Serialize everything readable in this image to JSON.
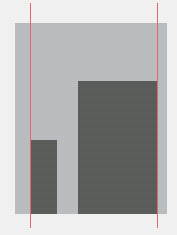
{
  "figure": {
    "title": "",
    "canvas_width": 177,
    "canvas_height": 235,
    "background_color": "#f2f2f2",
    "panel_color": "#b9bdc0",
    "bar_color": "#595b59",
    "guide_color": "#e8646a",
    "caption": ""
  },
  "chart_data": {
    "type": "bar",
    "title": "",
    "subtitle": "",
    "xlabel": "",
    "ylabel": "",
    "categories": [
      "bar-1",
      "bar-2"
    ],
    "values": [
      74,
      133
    ],
    "value_unit": "px",
    "ylim": [
      0,
      191
    ],
    "xlim": [
      0,
      152
    ],
    "grid": false,
    "legend": null,
    "legend_position": "none",
    "tick_labels": {
      "x": [],
      "y": []
    },
    "bars": [
      {
        "name": "bar-1",
        "value": 74,
        "x_left": 15,
        "x_right": 42,
        "width": 27,
        "height": 74,
        "color": "#595b59"
      },
      {
        "name": "bar-2",
        "value": 133,
        "x_left": 63,
        "x_right": 142,
        "width": 79,
        "height": 133,
        "color": "#595b59"
      }
    ],
    "annotations": [
      {
        "name": "guide-line-left",
        "type": "vline",
        "x": 15,
        "color": "#e8646a",
        "linewidth": 1,
        "label": ""
      },
      {
        "name": "guide-line-right",
        "type": "vline",
        "x": 142,
        "color": "#e8646a",
        "linewidth": 1,
        "label": ""
      }
    ]
  }
}
